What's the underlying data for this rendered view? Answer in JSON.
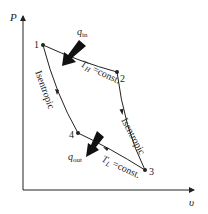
{
  "diagram": {
    "type": "P-v diagram",
    "axes": {
      "y_label": "P",
      "x_label": "υ"
    },
    "points": [
      {
        "id": "1",
        "label": "1"
      },
      {
        "id": "2",
        "label": "2"
      },
      {
        "id": "3",
        "label": "3"
      },
      {
        "id": "4",
        "label": "4"
      }
    ],
    "processes": {
      "p12": "T",
      "p12_sub": "H",
      "p12_rest": " =const.",
      "p23": "Isentropic",
      "p34": "T",
      "p34_sub": "L",
      "p34_rest": " =const.",
      "p41": "Isentropic"
    },
    "heat": {
      "in_main": "q",
      "in_sub": "in",
      "out_main": "q",
      "out_sub": "out"
    },
    "colors": {
      "line": "#222222",
      "background": "#ffffff"
    }
  }
}
